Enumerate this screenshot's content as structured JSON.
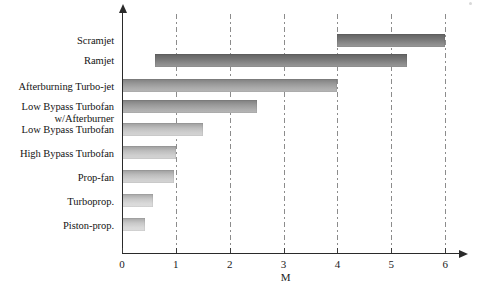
{
  "chart_data": {
    "type": "bar",
    "orientation": "horizontal",
    "title": "",
    "xlabel": "M",
    "ylabel": "",
    "xlim": [
      0,
      6.35
    ],
    "xticks": [
      0,
      1,
      2,
      3,
      4,
      5,
      6
    ],
    "xticklabels": [
      "0",
      "1",
      "2",
      "3",
      "4",
      "5",
      "6"
    ],
    "grid": true,
    "grid_axis": "x",
    "grid_style": "dash-dot",
    "legend": false,
    "categories": [
      "Scramjet",
      "Ramjet",
      "Afterburning Turbo-jet",
      "Low Bypass Turbofan w/Afterburner",
      "Low Bypass Turbofan",
      "High Bypass Turbofan",
      "Prop-fan",
      "Turboprop.",
      "Piston-prop."
    ],
    "bars": [
      {
        "category": "Scramjet",
        "start": 4.0,
        "end": 6.0,
        "shade": "dark"
      },
      {
        "category": "Ramjet",
        "start": 0.62,
        "end": 5.3,
        "shade": "dark"
      },
      {
        "category": "Afterburning Turbo-jet",
        "start": 0.0,
        "end": 4.0,
        "shade": "mid"
      },
      {
        "category": "Low Bypass Turbofan w/Afterburner",
        "start": 0.0,
        "end": 2.5,
        "shade": "mid"
      },
      {
        "category": "Low Bypass Turbofan",
        "start": 0.0,
        "end": 1.5,
        "shade": "light"
      },
      {
        "category": "High Bypass Turbofan",
        "start": 0.0,
        "end": 1.0,
        "shade": "light"
      },
      {
        "category": "Prop-fan",
        "start": 0.0,
        "end": 0.97,
        "shade": "light"
      },
      {
        "category": "Turboprop.",
        "start": 0.0,
        "end": 0.57,
        "shade": "vlight"
      },
      {
        "category": "Piston-prop.",
        "start": 0.0,
        "end": 0.42,
        "shade": "vlight"
      }
    ]
  },
  "labels": {
    "scramjet": "Scramjet",
    "ramjet": "Ramjet",
    "afterburning_turbojet": "Afterburning Turbo-jet",
    "low_bypass_turbofan_ab_line1": "Low Bypass Turbofan",
    "low_bypass_turbofan_ab_line2": "w/Afterburner",
    "low_bypass_turbofan": "Low Bypass Turbofan",
    "high_bypass_turbofan": "High Bypass Turbofan",
    "prop_fan": "Prop-fan",
    "turboprop": "Turboprop.",
    "piston_prop": "Piston-prop."
  },
  "ticks": {
    "t0": "0",
    "t1": "1",
    "t2": "2",
    "t3": "3",
    "t4": "4",
    "t5": "5",
    "t6": "6"
  },
  "axis_title": "M",
  "colors": {
    "bar_dark": "#7d7d7d",
    "bar_mid": "#a3a3a3",
    "bar_light": "#c9c9c9",
    "bar_vlight": "#d4d4d4",
    "axis": "#2a2a2a",
    "gridline": "#8c8c8c",
    "text": "#141414",
    "background": "#ffffff"
  }
}
